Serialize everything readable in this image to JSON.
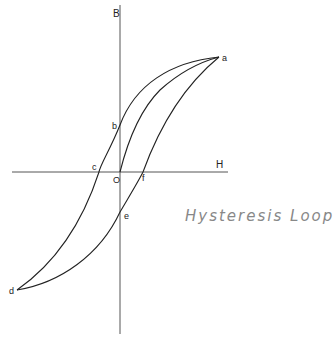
{
  "diagram": {
    "title": "Hysteresis Loop",
    "axes": {
      "y_label": "B",
      "x_label": "H",
      "origin_label": "O"
    },
    "points": {
      "a": {
        "label": "a",
        "x": 219,
        "y": 57
      },
      "b": {
        "label": "b",
        "x": 120,
        "y": 125
      },
      "c": {
        "label": "c",
        "x": 99,
        "y": 172
      },
      "d": {
        "label": "d",
        "x": 17,
        "y": 290
      },
      "e": {
        "label": "e",
        "x": 120,
        "y": 212
      },
      "f": {
        "label": "f",
        "x": 143,
        "y": 172
      }
    },
    "line_color": "#222222",
    "title_color": "#888888"
  }
}
